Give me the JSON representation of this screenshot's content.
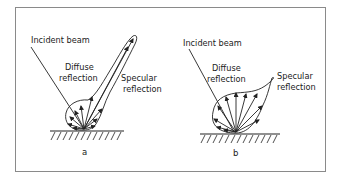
{
  "panels": [
    {
      "id": "a",
      "caption": "a",
      "labels": {
        "incident": "Incident beam",
        "diffuse_line1": "Diffuse",
        "diffuse_line2": "reflection",
        "specular_line1": "Specular",
        "specular_line2": "reflection"
      }
    },
    {
      "id": "b",
      "caption": "b",
      "labels": {
        "incident": "Incident beam",
        "diffuse_line1": "Diffuse",
        "diffuse_line2": "reflection",
        "specular_line1": "Specular",
        "specular_line2": "reflection"
      }
    }
  ],
  "colors": {
    "stroke": "#222222",
    "frame": "#8a8a8a",
    "background": "#ffffff"
  }
}
